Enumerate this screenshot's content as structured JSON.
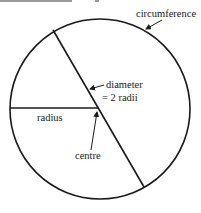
{
  "diagram": {
    "type": "circle-parts",
    "top_cut_text": "Figure 1.1  Parts of a circle",
    "labels": {
      "circumference": "circumference",
      "diameter_line1": "diameter",
      "diameter_line2": "= 2 radii",
      "radius": "radius",
      "centre": "centre"
    },
    "colors": {
      "stroke": "#1a1a1a",
      "background": "#ffffff"
    }
  }
}
